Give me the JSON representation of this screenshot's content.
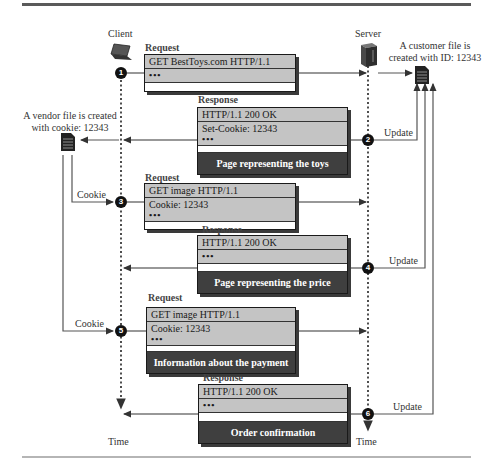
{
  "actors": {
    "client": {
      "label": "Client",
      "icon": "laptop-icon",
      "time_label": "Time"
    },
    "server": {
      "label": "Server",
      "icon": "server-icon",
      "time_label": "Time"
    }
  },
  "files": {
    "customer": {
      "line1": "A customer file is",
      "line2": "created with ID: 12343",
      "icon": "document-icon"
    },
    "vendor": {
      "line1": "A vendor file is created",
      "line2": "with cookie: 12343",
      "icon": "document-icon"
    }
  },
  "messages": [
    {
      "step": "1",
      "kind": "Request",
      "line1": "GET   BestToys.com  HTTP/1.1",
      "line2": "•••",
      "body": ""
    },
    {
      "step": "2",
      "kind": "Response",
      "line1": "HTTP/1.1   200  OK",
      "line2": "Set-Cookie: 12343",
      "line3": "•••",
      "body": "Page representing the toys"
    },
    {
      "step": "3",
      "kind": "Request",
      "line1": "GET   image  HTTP/1.1",
      "line2": "Cookie: 12343",
      "line3": "•••",
      "body": ""
    },
    {
      "step": "4",
      "kind": "Response",
      "line1": "HTTP/1.1   200  OK",
      "line2": "•••",
      "body": "Page representing the price"
    },
    {
      "step": "5",
      "kind": "Request",
      "line1": "GET   image  HTTP/1.1",
      "line2": "Cookie: 12343",
      "line3": "•••",
      "body": "Information about the payment"
    },
    {
      "step": "6",
      "kind": "Response",
      "line1": "HTTP/1.1   200  OK",
      "line2": "•••",
      "body": "Order confirmation"
    }
  ],
  "edge_labels": {
    "cookie_3": "Cookie",
    "cookie_5": "Cookie",
    "update_2": "Update",
    "update_4": "Update",
    "update_6": "Update"
  },
  "colors": {
    "header_row": "#c4c4c4",
    "body_band": "#3f3f3f",
    "line": "#333333"
  }
}
